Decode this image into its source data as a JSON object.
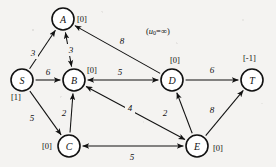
{
  "figure": {
    "annotation": {
      "text_full": "(u0=∞)",
      "prefix": "(",
      "symbol": "u",
      "subscript": "0",
      "relation_value": "=∞",
      "suffix": ")"
    },
    "colors": {
      "background": "#f4f3f1",
      "node_fill": "#ffffff",
      "stroke": "#111111",
      "text": "#111111"
    }
  },
  "graph_data": {
    "type": "directed-network",
    "nodes": [
      {
        "id": "S",
        "label": "S",
        "potential": "[1]",
        "cx": 22,
        "cy": 80,
        "r": 11,
        "potential_x": 11,
        "potential_y": 97
      },
      {
        "id": "A",
        "label": "A",
        "potential": "[0]",
        "cx": 63,
        "cy": 19,
        "r": 11,
        "potential_x": 77,
        "potential_y": 19
      },
      {
        "id": "B",
        "label": "B",
        "potential": "[0]",
        "cx": 74,
        "cy": 80,
        "r": 11,
        "potential_x": 87,
        "potential_y": 70
      },
      {
        "id": "C",
        "label": "C",
        "potential": "[0]",
        "cx": 69,
        "cy": 146,
        "r": 11,
        "potential_x": 42,
        "potential_y": 146
      },
      {
        "id": "D",
        "label": "D",
        "potential": "[0]",
        "cx": 172,
        "cy": 80,
        "r": 11,
        "potential_x": 170,
        "potential_y": 60
      },
      {
        "id": "E",
        "label": "E",
        "potential": "[0]",
        "cx": 197,
        "cy": 146,
        "r": 11,
        "potential_x": 213,
        "potential_y": 148
      },
      {
        "id": "T",
        "label": "T",
        "potential": "[-1]",
        "cx": 252,
        "cy": 80,
        "r": 11,
        "potential_x": 243,
        "potential_y": 58
      }
    ],
    "edges": [
      {
        "from": "S",
        "to": "A",
        "cost": "3",
        "direction": "forward",
        "label_x": 33,
        "label_y": 53
      },
      {
        "from": "S",
        "to": "B",
        "cost": "6",
        "direction": "forward",
        "label_x": 48,
        "label_y": 72
      },
      {
        "from": "S",
        "to": "C",
        "cost": "5",
        "direction": "forward",
        "label_x": 32,
        "label_y": 118
      },
      {
        "from": "B",
        "to": "A",
        "cost": "3",
        "direction": "bidirectional",
        "label_x": 71,
        "label_y": 50
      },
      {
        "from": "C",
        "to": "B",
        "cost": "2",
        "direction": "forward",
        "label_x": 64,
        "label_y": 113
      },
      {
        "from": "B",
        "to": "D",
        "cost": "5",
        "direction": "bidirectional",
        "label_x": 120,
        "label_y": 72
      },
      {
        "from": "B",
        "to": "E",
        "cost": "4",
        "direction": "bidirectional",
        "label_x": 130,
        "label_y": 108
      },
      {
        "from": "D",
        "to": "A",
        "cost": "8",
        "direction": "forward",
        "label_x": 122,
        "label_y": 41
      },
      {
        "from": "E",
        "to": "D",
        "cost": "2",
        "direction": "forward",
        "label_x": 165,
        "label_y": 113
      },
      {
        "from": "E",
        "to": "C",
        "cost": "5",
        "direction": "bidirectional",
        "label_x": 132,
        "label_y": 157
      },
      {
        "from": "D",
        "to": "T",
        "cost": "6",
        "direction": "forward",
        "label_x": 212,
        "label_y": 70
      },
      {
        "from": "E",
        "to": "T",
        "cost": "8",
        "direction": "forward",
        "label_x": 212,
        "label_y": 110
      }
    ]
  }
}
